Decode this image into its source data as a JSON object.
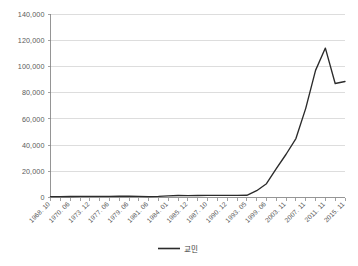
{
  "chart_data": {
    "type": "line",
    "title": "",
    "subtitle": "",
    "xlabel": "",
    "ylabel": "",
    "ylim": [
      0,
      140000
    ],
    "grid": true,
    "legend_position": "bottom-center",
    "y_ticks": [
      "0",
      "20,000",
      "40,000",
      "60,000",
      "80,000",
      "100,000",
      "120,000",
      "140,000"
    ],
    "y_tick_values": [
      0,
      20000,
      40000,
      60000,
      80000,
      100000,
      120000,
      140000
    ],
    "categories": [
      "1968. 10",
      "1969. 08",
      "1970. 06",
      "1972. 03",
      "1973. 12",
      "1975. 09",
      "1977. 06",
      "1978. 06",
      "1979. 06",
      "1980. 06",
      "1981. 06",
      "1982. 09",
      "1984. 01",
      "1985. 01",
      "1985. 12",
      "1986. 11",
      "1987. 10",
      "1989. 05",
      "1990. 12",
      "1992. 03",
      "1993. 05",
      "1996. 06",
      "1999. 06",
      "2001. 08",
      "2003. 11",
      "2005. 11",
      "2007. 11",
      "2009. 11",
      "2011. 11",
      "2013. 11",
      "2015. 11"
    ],
    "x_tick_labels_shown": [
      "1968. 10",
      "1970. 06",
      "1973. 12",
      "1977. 06",
      "1979. 06",
      "1981. 06",
      "1984. 01",
      "1985. 12",
      "1987. 10",
      "1990. 12",
      "1993. 05",
      "1999. 06",
      "2003. 11",
      "2007. 11",
      "2011. 11",
      "2015. 11"
    ],
    "series": [
      {
        "name": "교민",
        "color": "#2b2b2b",
        "values": [
          700,
          700,
          750,
          800,
          850,
          900,
          900,
          950,
          950,
          900,
          700,
          900,
          1300,
          1500,
          1400,
          1500,
          1600,
          1600,
          1600,
          1600,
          1700,
          5200,
          10500,
          22000,
          33000,
          45000,
          68000,
          97000,
          114000,
          87000,
          88500
        ]
      }
    ]
  },
  "legend": {
    "entries": [
      {
        "label": "교민",
        "color": "#2b2b2b"
      }
    ]
  }
}
